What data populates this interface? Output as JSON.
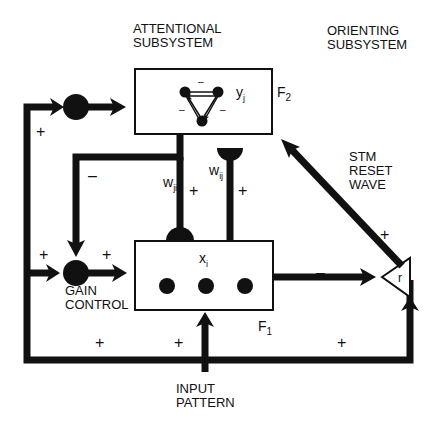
{
  "headers": {
    "attentional": [
      "ATTENTIONAL",
      "SUBSYSTEM"
    ],
    "orienting": [
      "ORIENTING",
      "SUBSYSTEM"
    ]
  },
  "f2": {
    "label": "F",
    "sub": "2",
    "node_label": "y",
    "node_sub": "j",
    "inner_signs": [
      "–",
      "–",
      "–"
    ]
  },
  "f1": {
    "label": "F",
    "sub": "1",
    "node_label": "x",
    "node_sub": "i"
  },
  "weights": {
    "top_down": {
      "label": "w",
      "sub": "ji"
    },
    "bottom_up": {
      "label": "w",
      "sub": "ij"
    }
  },
  "gain_control": [
    "GAIN",
    "CONTROL"
  ],
  "reset": [
    "STM",
    "RESET",
    "WAVE"
  ],
  "orienting_node": "r",
  "input": [
    "INPUT",
    "PATTERN"
  ],
  "signs": {
    "left_upper_plus": "+",
    "inhibit_minus": "–",
    "top_down_plus": "+",
    "bottom_up_plus": "+",
    "gain_left_plus": "+",
    "gain_right_plus": "+",
    "bottom_left_plus": "+",
    "bottom_mid_plus": "+",
    "bottom_right_plus": "+",
    "f1_to_r_minus": "–",
    "reset_plus": "+"
  }
}
